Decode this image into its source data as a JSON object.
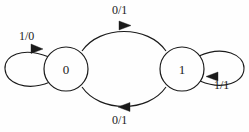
{
  "diagram": {
    "type": "state-transition-diagram",
    "stroke_color": "#1a1a1a",
    "background_color": "#fefefe",
    "states": [
      {
        "id": "s0",
        "label": "0",
        "cx": 66,
        "cy": 69,
        "r": 22
      },
      {
        "id": "s1",
        "label": "1",
        "cx": 182,
        "cy": 69,
        "r": 22
      }
    ],
    "transitions": [
      {
        "id": "t-self-left",
        "from": "0",
        "to": "0",
        "label": "1/0",
        "input": "1",
        "output": "0",
        "kind": "self-loop",
        "side": "left",
        "label_x": 19,
        "label_y": 30
      },
      {
        "id": "t-top",
        "from": "0",
        "to": "1",
        "label": "0/1",
        "input": "0",
        "output": "1",
        "kind": "arc",
        "side": "top",
        "label_x": 112,
        "label_y": 4
      },
      {
        "id": "t-bottom",
        "from": "1",
        "to": "0",
        "label": "0/1",
        "input": "0",
        "output": "1",
        "kind": "arc",
        "side": "bottom",
        "label_x": 112,
        "label_y": 114
      },
      {
        "id": "t-self-right",
        "from": "1",
        "to": "1",
        "label": "1/1",
        "input": "1",
        "output": "1",
        "kind": "self-loop",
        "side": "right",
        "label_x": 214,
        "label_y": 79
      }
    ]
  }
}
